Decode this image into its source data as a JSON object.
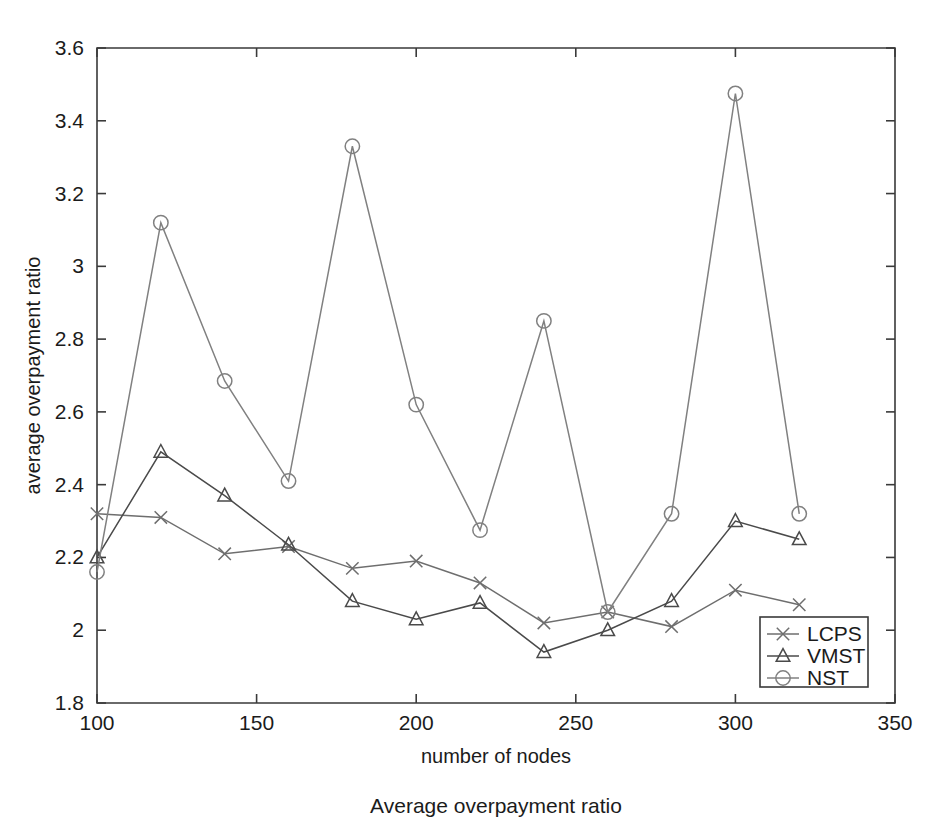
{
  "chart_data": {
    "type": "line",
    "title": "",
    "xlabel": "number of nodes",
    "ylabel": "average overpayment ratio",
    "caption": "Average overpayment ratio",
    "x": [
      100,
      120,
      140,
      160,
      180,
      200,
      220,
      240,
      260,
      280,
      300,
      320
    ],
    "xlim": [
      100,
      350
    ],
    "ylim": [
      1.8,
      3.6
    ],
    "xticks": [
      100,
      150,
      200,
      250,
      300,
      350
    ],
    "xtick_labels": [
      "100",
      "150",
      "200",
      "250",
      "300",
      "350"
    ],
    "yticks": [
      1.8,
      2.0,
      2.2,
      2.4,
      2.6,
      2.8,
      3.0,
      3.2,
      3.4,
      3.6
    ],
    "ytick_labels": [
      "1.8",
      "2",
      "2.2",
      "2.4",
      "2.6",
      "2.8",
      "3",
      "3.2",
      "3.4",
      "3.6"
    ],
    "grid": false,
    "legend_position": "lower right",
    "series": [
      {
        "name": "LCPS",
        "marker": "cross",
        "color": "#6e6e6e",
        "values": [
          2.32,
          2.31,
          2.21,
          2.23,
          2.17,
          2.19,
          2.13,
          2.02,
          2.05,
          2.01,
          2.11,
          2.07
        ]
      },
      {
        "name": "VMST",
        "marker": "triangle",
        "color": "#4a4a4a",
        "values": [
          2.2,
          2.49,
          2.37,
          2.235,
          2.08,
          2.03,
          2.075,
          1.94,
          2.0,
          2.08,
          2.3,
          2.25
        ]
      },
      {
        "name": "NST",
        "marker": "circle",
        "color": "#808080",
        "values": [
          2.16,
          3.12,
          2.685,
          2.41,
          3.33,
          2.62,
          2.275,
          2.85,
          2.05,
          2.32,
          3.475,
          2.32
        ]
      }
    ]
  }
}
